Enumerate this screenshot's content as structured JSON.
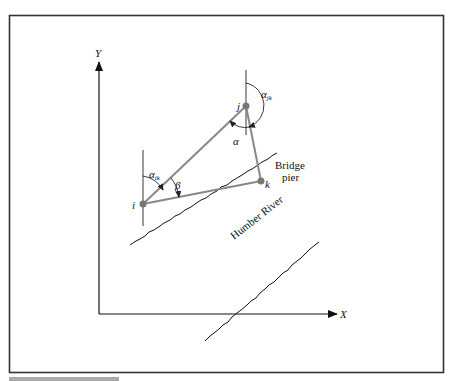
{
  "figure": {
    "axes": {
      "x_label": "X",
      "y_label": "Y"
    },
    "points": [
      {
        "id": "i",
        "label": "i",
        "x": 143,
        "y": 204
      },
      {
        "id": "j",
        "label": "j",
        "x": 246,
        "y": 106
      },
      {
        "id": "k",
        "label": "k",
        "x": 261,
        "y": 181
      }
    ],
    "angle_labels": {
      "alpha_ik": "α",
      "alpha_ik_sub": "ik",
      "beta": "β",
      "alpha_jk": "α",
      "alpha_jk_sub": "jk",
      "alpha": "α"
    },
    "annotations": {
      "bridge_line1": "Bridge",
      "bridge_line2": "pier",
      "river": "Humber River"
    },
    "caption_partial": "FIGURE 7.7"
  }
}
